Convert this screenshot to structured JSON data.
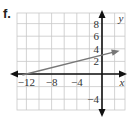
{
  "problem_label": "f.",
  "chart_data": {
    "type": "line",
    "title": "",
    "xlabel": "x",
    "ylabel": "y",
    "xlim": [
      -13.5,
      3.5
    ],
    "ylim": [
      -5.8,
      9.7
    ],
    "grid": true,
    "grid_step": 2,
    "x_ticks": [
      -12,
      -8,
      -4
    ],
    "x_tick_labels": [
      "−12",
      "−8",
      "−4"
    ],
    "y_ticks": [
      8,
      6,
      4,
      2,
      -4
    ],
    "y_tick_labels": [
      "8",
      "6",
      "4",
      "2",
      "−4"
    ],
    "series": [
      {
        "name": "line",
        "equation": "y = x/4 + 3",
        "x": [
          -12,
          2.8
        ],
        "y": [
          0,
          3.7
        ],
        "color": "#777777",
        "arrow_end": true
      }
    ],
    "axis_color": "#111111",
    "grid_color": "#c8c8c8"
  }
}
